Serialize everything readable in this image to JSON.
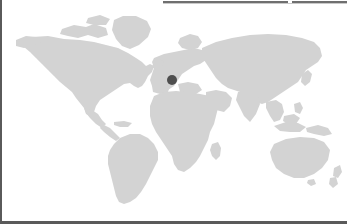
{
  "widget": {
    "type": "world-map-location-picker",
    "title": "",
    "background_color": "#ffffff",
    "land_color": "#d3d3d3",
    "ocean_color": "#ffffff",
    "border_color": "#5a5a5a",
    "rule_color": "#6f6f6f"
  },
  "map": {
    "projection": "equirectangular",
    "lon_range": [
      -180,
      180
    ],
    "lat_range": [
      -60,
      84
    ],
    "graticule": false,
    "labels": [],
    "legend": []
  },
  "markers": [
    {
      "name": "selected-location",
      "color": "#4e4e4e",
      "radius_px": 5,
      "x_px": 172,
      "y_px": 80,
      "region": "Central Europe",
      "label": ""
    }
  ],
  "chrome": {
    "top_rule_segments": 2,
    "left_border_px": 2,
    "bottom_border_px": 3
  }
}
